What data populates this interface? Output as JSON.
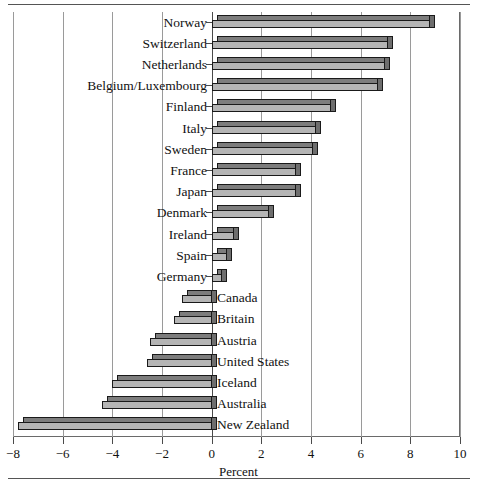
{
  "chart_data": {
    "type": "bar",
    "orientation": "horizontal",
    "title": "",
    "xlabel": "Percent",
    "ylabel": "",
    "xlim": [
      -8,
      10
    ],
    "xticks": [
      -8,
      -6,
      -4,
      -2,
      0,
      2,
      4,
      6,
      8,
      10
    ],
    "xticklabels": [
      "−8",
      "−6",
      "−4",
      "−2",
      "0",
      "2",
      "4",
      "6",
      "8",
      "10"
    ],
    "grid": true,
    "legend": null,
    "categories": [
      "Norway",
      "Switzerland",
      "Netherlands",
      "Belgium/Luxembourg",
      "Finland",
      "Italy",
      "Sweden",
      "France",
      "Japan",
      "Denmark",
      "Ireland",
      "Spain",
      "Germany",
      "Canada",
      "Britain",
      "Austria",
      "United States",
      "Iceland",
      "Australia",
      "New Zealand"
    ],
    "values": [
      8.8,
      7.1,
      7.0,
      6.7,
      4.8,
      4.2,
      4.1,
      3.4,
      3.4,
      2.3,
      0.9,
      0.6,
      0.4,
      -1.2,
      -1.5,
      -2.5,
      -2.6,
      -4.0,
      -4.4,
      -7.8
    ]
  },
  "colors": {
    "bar_front": "#b5b5b5",
    "bar_top": "#7d7d7d",
    "bar_cap": "#6e6e6e",
    "bar_outline": "#1a1a1a",
    "gridline": "#9a9a9a",
    "axis": "#4a4a4a",
    "background": "#ffffff"
  }
}
